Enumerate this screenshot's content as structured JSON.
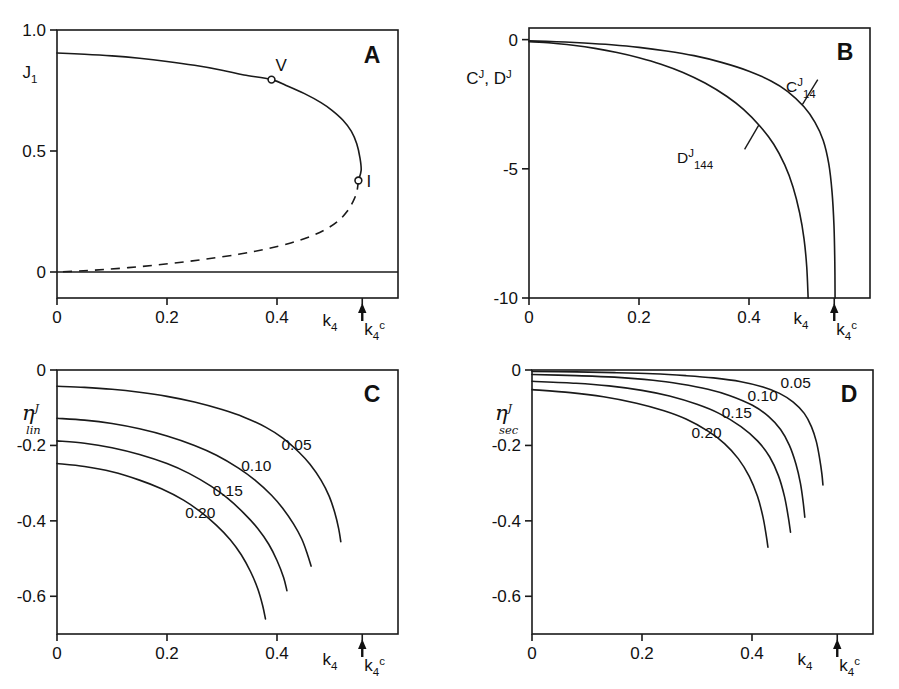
{
  "figure": {
    "background": "#ffffff",
    "ink_color": "#1a1a1a",
    "panel_count": 4
  },
  "chart_data": [
    {
      "id": "A",
      "panel_letter": "A",
      "type": "line",
      "title": "",
      "xlabel": "k_4",
      "ylabel": "J_1",
      "ylabel_base": "J",
      "ylabel_sub": "1",
      "xlabel_base": "k",
      "xlabel_sub": "4",
      "xlim": [
        0,
        0.62
      ],
      "ylim": [
        -0.09,
        1.0
      ],
      "xticks": [
        0,
        0.2,
        0.4
      ],
      "xticklabels": [
        "0",
        "0.2",
        "0.4"
      ],
      "yticks": [
        0,
        0.5,
        1.0
      ],
      "yticklabels": [
        "0",
        "0.5",
        "1.0"
      ],
      "grid": false,
      "legend": "none",
      "critical_tick": {
        "label_base": "k",
        "label_sub": "4",
        "label_sup": "c",
        "value": 0.555,
        "arrow": "up"
      },
      "annotations": [
        {
          "text": "V",
          "x": 0.39,
          "y": 0.795,
          "marker": "open-circle"
        },
        {
          "text": "I",
          "x": 0.548,
          "y": 0.378,
          "marker": "open-circle"
        }
      ],
      "series": [
        {
          "name": "upper-stable-branch",
          "style": "solid",
          "points": [
            [
              0.0,
              0.905
            ],
            [
              0.05,
              0.9
            ],
            [
              0.1,
              0.893
            ],
            [
              0.15,
              0.883
            ],
            [
              0.2,
              0.87
            ],
            [
              0.25,
              0.854
            ],
            [
              0.3,
              0.834
            ],
            [
              0.34,
              0.814
            ],
            [
              0.39,
              0.795
            ],
            [
              0.42,
              0.768
            ],
            [
              0.45,
              0.737
            ],
            [
              0.48,
              0.7
            ],
            [
              0.5,
              0.668
            ],
            [
              0.52,
              0.627
            ],
            [
              0.535,
              0.582
            ],
            [
              0.545,
              0.53
            ],
            [
              0.551,
              0.47
            ],
            [
              0.553,
              0.42
            ],
            [
              0.548,
              0.378
            ]
          ]
        },
        {
          "name": "lower-unstable-branch",
          "style": "dashed",
          "points": [
            [
              0.548,
              0.378
            ],
            [
              0.545,
              0.33
            ],
            [
              0.538,
              0.29
            ],
            [
              0.528,
              0.252
            ],
            [
              0.512,
              0.212
            ],
            [
              0.49,
              0.178
            ],
            [
              0.462,
              0.148
            ],
            [
              0.425,
              0.12
            ],
            [
              0.38,
              0.095
            ],
            [
              0.33,
              0.073
            ],
            [
              0.27,
              0.053
            ],
            [
              0.21,
              0.036
            ],
            [
              0.15,
              0.022
            ],
            [
              0.09,
              0.011
            ],
            [
              0.04,
              0.004
            ],
            [
              0.0,
              0.0
            ]
          ]
        },
        {
          "name": "zero-branch",
          "style": "solid-horizontal",
          "y_value": 0.0
        }
      ]
    },
    {
      "id": "B",
      "panel_letter": "B",
      "type": "line",
      "title": "",
      "xlabel": "k_4",
      "ylabel": "C^J, D^J",
      "ylabel_parts": [
        {
          "base": "C",
          "sup": "J"
        },
        {
          "text": ", "
        },
        {
          "base": "D",
          "sup": "J"
        }
      ],
      "xlim": [
        0,
        0.62
      ],
      "ylim": [
        -10,
        0.45
      ],
      "xticks": [
        0,
        0.2,
        0.4
      ],
      "xticklabels": [
        "0",
        "0.2",
        "0.4"
      ],
      "yticks": [
        0,
        -5,
        -10
      ],
      "yticklabels": [
        "0",
        "-5",
        "-10"
      ],
      "grid": false,
      "legend": "inline-labels",
      "critical_tick": {
        "label_base": "k",
        "label_sub": "4",
        "label_sup": "c",
        "value": 0.555,
        "arrow": "up"
      },
      "series": [
        {
          "name": "C-14",
          "label_base": "C",
          "label_sup": "J",
          "label_sub": "14",
          "style": "solid",
          "points": [
            [
              0.0,
              -0.05
            ],
            [
              0.05,
              -0.08
            ],
            [
              0.1,
              -0.13
            ],
            [
              0.15,
              -0.2
            ],
            [
              0.2,
              -0.3
            ],
            [
              0.25,
              -0.44
            ],
            [
              0.3,
              -0.62
            ],
            [
              0.35,
              -0.88
            ],
            [
              0.4,
              -1.22
            ],
            [
              0.44,
              -1.6
            ],
            [
              0.47,
              -2.0
            ],
            [
              0.5,
              -2.6
            ],
            [
              0.52,
              -3.2
            ],
            [
              0.535,
              -3.9
            ],
            [
              0.545,
              -4.8
            ],
            [
              0.551,
              -5.9
            ],
            [
              0.5545,
              -7.2
            ],
            [
              0.556,
              -8.6
            ],
            [
              0.5565,
              -10.0
            ]
          ]
        },
        {
          "name": "D-144",
          "label_base": "D",
          "label_sup": "J",
          "label_sub": "144",
          "style": "solid",
          "points": [
            [
              0.0,
              -0.08
            ],
            [
              0.04,
              -0.13
            ],
            [
              0.08,
              -0.22
            ],
            [
              0.12,
              -0.34
            ],
            [
              0.16,
              -0.5
            ],
            [
              0.2,
              -0.7
            ],
            [
              0.24,
              -0.95
            ],
            [
              0.28,
              -1.27
            ],
            [
              0.32,
              -1.68
            ],
            [
              0.36,
              -2.2
            ],
            [
              0.39,
              -2.7
            ],
            [
              0.42,
              -3.35
            ],
            [
              0.445,
              -4.05
            ],
            [
              0.465,
              -4.85
            ],
            [
              0.48,
              -5.7
            ],
            [
              0.492,
              -6.7
            ],
            [
              0.5,
              -7.7
            ],
            [
              0.505,
              -8.8
            ],
            [
              0.5075,
              -10.0
            ]
          ]
        }
      ]
    },
    {
      "id": "C",
      "panel_letter": "C",
      "type": "line",
      "title": "",
      "xlabel": "k_4",
      "ylabel": "eta^J_lin",
      "ylabel_base": "η",
      "ylabel_sup": "J",
      "ylabel_sub": "lin",
      "xlim": [
        0,
        0.62
      ],
      "ylim": [
        -0.7,
        0.0
      ],
      "xticks": [
        0,
        0.2,
        0.4
      ],
      "xticklabels": [
        "0",
        "0.2",
        "0.4"
      ],
      "yticks": [
        0,
        -0.2,
        -0.4,
        -0.6
      ],
      "yticklabels": [
        "0",
        "-0.2",
        "-0.4",
        "-0.6"
      ],
      "grid": false,
      "legend": "inline-labels",
      "critical_tick": {
        "label_base": "k",
        "label_sub": "4",
        "label_sup": "c",
        "value": 0.555,
        "arrow": "up"
      },
      "series": [
        {
          "name": "curve-0.05",
          "label": "0.05",
          "label_x": 0.408,
          "label_y": -0.212,
          "points": [
            [
              0.0,
              -0.043
            ],
            [
              0.05,
              -0.046
            ],
            [
              0.1,
              -0.051
            ],
            [
              0.15,
              -0.059
            ],
            [
              0.2,
              -0.07
            ],
            [
              0.25,
              -0.085
            ],
            [
              0.3,
              -0.105
            ],
            [
              0.34,
              -0.125
            ],
            [
              0.38,
              -0.152
            ],
            [
              0.41,
              -0.18
            ],
            [
              0.44,
              -0.218
            ],
            [
              0.46,
              -0.25
            ],
            [
              0.48,
              -0.292
            ],
            [
              0.495,
              -0.335
            ],
            [
              0.505,
              -0.378
            ],
            [
              0.512,
              -0.42
            ],
            [
              0.516,
              -0.455
            ]
          ]
        },
        {
          "name": "curve-0.10",
          "label": "0.10",
          "label_x": 0.335,
          "label_y": -0.268,
          "points": [
            [
              0.0,
              -0.128
            ],
            [
              0.05,
              -0.133
            ],
            [
              0.1,
              -0.142
            ],
            [
              0.15,
              -0.156
            ],
            [
              0.2,
              -0.175
            ],
            [
              0.25,
              -0.2
            ],
            [
              0.29,
              -0.226
            ],
            [
              0.33,
              -0.26
            ],
            [
              0.36,
              -0.292
            ],
            [
              0.39,
              -0.332
            ],
            [
              0.41,
              -0.366
            ],
            [
              0.43,
              -0.408
            ],
            [
              0.445,
              -0.448
            ],
            [
              0.455,
              -0.487
            ],
            [
              0.462,
              -0.52
            ]
          ]
        },
        {
          "name": "curve-0.15",
          "label": "0.15",
          "label_x": 0.283,
          "label_y": -0.333,
          "points": [
            [
              0.0,
              -0.188
            ],
            [
              0.05,
              -0.194
            ],
            [
              0.1,
              -0.206
            ],
            [
              0.15,
              -0.224
            ],
            [
              0.2,
              -0.248
            ],
            [
              0.24,
              -0.274
            ],
            [
              0.28,
              -0.308
            ],
            [
              0.31,
              -0.34
            ],
            [
              0.34,
              -0.38
            ],
            [
              0.365,
              -0.42
            ],
            [
              0.385,
              -0.462
            ],
            [
              0.4,
              -0.505
            ],
            [
              0.412,
              -0.55
            ],
            [
              0.418,
              -0.585
            ]
          ]
        },
        {
          "name": "curve-0.20",
          "label": "0.20",
          "label_x": 0.233,
          "label_y": -0.392,
          "points": [
            [
              0.0,
              -0.248
            ],
            [
              0.05,
              -0.256
            ],
            [
              0.1,
              -0.27
            ],
            [
              0.15,
              -0.292
            ],
            [
              0.19,
              -0.315
            ],
            [
              0.23,
              -0.345
            ],
            [
              0.26,
              -0.375
            ],
            [
              0.29,
              -0.412
            ],
            [
              0.315,
              -0.45
            ],
            [
              0.335,
              -0.49
            ],
            [
              0.352,
              -0.535
            ],
            [
              0.365,
              -0.58
            ],
            [
              0.374,
              -0.625
            ],
            [
              0.379,
              -0.66
            ]
          ]
        }
      ]
    },
    {
      "id": "D",
      "panel_letter": "D",
      "type": "line",
      "title": "",
      "xlabel": "k_4",
      "ylabel": "eta^J_sec",
      "ylabel_base": "η",
      "ylabel_sup": "J",
      "ylabel_sub": "sec",
      "xlim": [
        0,
        0.62
      ],
      "ylim": [
        -0.7,
        0.0
      ],
      "xticks": [
        0,
        0.2,
        0.4
      ],
      "xticklabels": [
        "0",
        "0.2",
        "0.4"
      ],
      "yticks": [
        0,
        -0.2,
        -0.4,
        -0.6
      ],
      "yticklabels": [
        "0",
        "-0.2",
        "-0.4",
        "-0.6"
      ],
      "grid": false,
      "legend": "inline-labels",
      "critical_tick": {
        "label_base": "k",
        "label_sub": "4",
        "label_sup": "c",
        "value": 0.555,
        "arrow": "up"
      },
      "series": [
        {
          "name": "curve-0.05",
          "label": "0.05",
          "label_x": 0.452,
          "label_y": -0.047,
          "points": [
            [
              0.0,
              -0.004
            ],
            [
              0.08,
              -0.005
            ],
            [
              0.15,
              -0.007
            ],
            [
              0.22,
              -0.01
            ],
            [
              0.28,
              -0.015
            ],
            [
              0.33,
              -0.021
            ],
            [
              0.38,
              -0.031
            ],
            [
              0.42,
              -0.045
            ],
            [
              0.45,
              -0.062
            ],
            [
              0.475,
              -0.085
            ],
            [
              0.495,
              -0.115
            ],
            [
              0.508,
              -0.15
            ],
            [
              0.517,
              -0.19
            ],
            [
              0.523,
              -0.235
            ],
            [
              0.527,
              -0.275
            ],
            [
              0.529,
              -0.305
            ]
          ]
        },
        {
          "name": "curve-0.10",
          "label": "0.10",
          "label_x": 0.392,
          "label_y": -0.082,
          "points": [
            [
              0.0,
              -0.012
            ],
            [
              0.08,
              -0.015
            ],
            [
              0.15,
              -0.019
            ],
            [
              0.22,
              -0.027
            ],
            [
              0.27,
              -0.037
            ],
            [
              0.32,
              -0.051
            ],
            [
              0.36,
              -0.068
            ],
            [
              0.4,
              -0.093
            ],
            [
              0.43,
              -0.123
            ],
            [
              0.452,
              -0.158
            ],
            [
              0.468,
              -0.2
            ],
            [
              0.48,
              -0.25
            ],
            [
              0.488,
              -0.3
            ],
            [
              0.493,
              -0.35
            ],
            [
              0.496,
              -0.39
            ]
          ]
        },
        {
          "name": "curve-0.15",
          "label": "0.15",
          "label_x": 0.345,
          "label_y": -0.128,
          "points": [
            [
              0.0,
              -0.03
            ],
            [
              0.08,
              -0.035
            ],
            [
              0.14,
              -0.042
            ],
            [
              0.2,
              -0.054
            ],
            [
              0.25,
              -0.069
            ],
            [
              0.3,
              -0.091
            ],
            [
              0.34,
              -0.115
            ],
            [
              0.38,
              -0.15
            ],
            [
              0.41,
              -0.188
            ],
            [
              0.432,
              -0.23
            ],
            [
              0.448,
              -0.28
            ],
            [
              0.459,
              -0.335
            ],
            [
              0.466,
              -0.39
            ],
            [
              0.47,
              -0.43
            ]
          ]
        },
        {
          "name": "curve-0.20",
          "label": "0.20",
          "label_x": 0.29,
          "label_y": -0.18,
          "points": [
            [
              0.0,
              -0.052
            ],
            [
              0.07,
              -0.06
            ],
            [
              0.13,
              -0.071
            ],
            [
              0.19,
              -0.088
            ],
            [
              0.24,
              -0.108
            ],
            [
              0.28,
              -0.13
            ],
            [
              0.32,
              -0.162
            ],
            [
              0.35,
              -0.195
            ],
            [
              0.375,
              -0.235
            ],
            [
              0.395,
              -0.282
            ],
            [
              0.41,
              -0.335
            ],
            [
              0.42,
              -0.39
            ],
            [
              0.426,
              -0.44
            ],
            [
              0.429,
              -0.47
            ]
          ]
        }
      ]
    }
  ]
}
